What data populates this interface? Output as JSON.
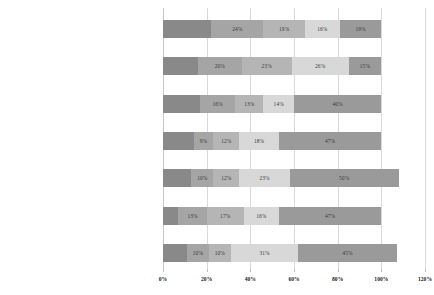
{
  "chart_data": {
    "type": "bar",
    "orientation": "horizontal",
    "stacked": true,
    "title": "",
    "xlabel": "",
    "ylabel": "",
    "xlim": [
      0,
      120
    ],
    "xticks": [
      "0%",
      "20%",
      "40%",
      "60%",
      "80%",
      "100%",
      "120%"
    ],
    "xtick_values": [
      0,
      20,
      40,
      60,
      80,
      100,
      120
    ],
    "grid": true,
    "legend": "none",
    "categories": [
      "Chatbots or conversational agents",
      "Machine-learning-Supported Data Mining",
      "Biometrics",
      "Computer Vision and Automated Image Recognition",
      "GeoAI",
      "Machine Translation",
      "Dee Learning"
    ],
    "series": [
      {
        "name": "s1",
        "color": "#898989",
        "values": [
          22,
          16,
          17,
          14,
          13,
          7,
          11
        ]
      },
      {
        "name": "s2",
        "color": "#a5a5a5",
        "values": [
          24,
          20,
          16,
          9,
          10,
          13,
          10
        ]
      },
      {
        "name": "s3",
        "color": "#b5b5b5",
        "values": [
          19,
          23,
          13,
          12,
          12,
          17,
          10
        ]
      },
      {
        "name": "s4",
        "color": "#d8d8d8",
        "values": [
          16,
          26,
          14,
          18,
          23,
          16,
          31
        ]
      },
      {
        "name": "s5",
        "color": "#9a9a9a",
        "values": [
          19,
          15,
          40,
          47,
          50,
          47,
          45
        ]
      }
    ],
    "bar_labels": [
      [
        "",
        "24%",
        "19%",
        "16%",
        "19%"
      ],
      [
        "",
        "20%",
        "23%",
        "26%",
        "15%"
      ],
      [
        "",
        "16%",
        "13%",
        "14%",
        "40%"
      ],
      [
        "",
        "9%",
        "12%",
        "18%",
        "47%"
      ],
      [
        "",
        "10%",
        "12%",
        "23%",
        "50%"
      ],
      [
        "",
        "13%",
        "17%",
        "16%",
        "47%"
      ],
      [
        "",
        "10%",
        "10%",
        "31%",
        "45%"
      ]
    ]
  }
}
